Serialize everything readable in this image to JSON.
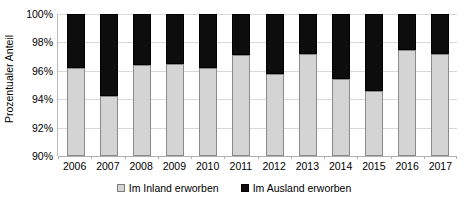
{
  "chart_data": {
    "type": "bar",
    "stacked": true,
    "title": "",
    "xlabel": "",
    "ylabel": "Prozentualer Anteil",
    "ylim": [
      90,
      100
    ],
    "ytick_labels": [
      "100%",
      "98%",
      "96%",
      "94%",
      "92%",
      "90%"
    ],
    "ytick_values": [
      100,
      98,
      96,
      94,
      92,
      90
    ],
    "grid": true,
    "legend_position": "bottom",
    "categories": [
      "2006",
      "2007",
      "2008",
      "2009",
      "2010",
      "2011",
      "2012",
      "2013",
      "2014",
      "2015",
      "2016",
      "2017"
    ],
    "series": [
      {
        "name": "Im Inland erworben",
        "color": "#d4d4d4",
        "values": [
          96.2,
          94.2,
          96.4,
          96.5,
          96.2,
          97.1,
          95.8,
          97.2,
          95.4,
          94.6,
          97.5,
          97.2
        ]
      },
      {
        "name": "Im Ausland erworben",
        "color": "#0d0d0d",
        "values": [
          3.8,
          5.8,
          3.6,
          3.5,
          3.8,
          2.9,
          4.2,
          2.8,
          4.6,
          5.4,
          2.5,
          2.8
        ]
      }
    ]
  },
  "legend": {
    "items": [
      {
        "label": "Im Inland erworben",
        "swatch": "domestic"
      },
      {
        "label": "Im Ausland erworben",
        "swatch": "foreign"
      }
    ]
  }
}
